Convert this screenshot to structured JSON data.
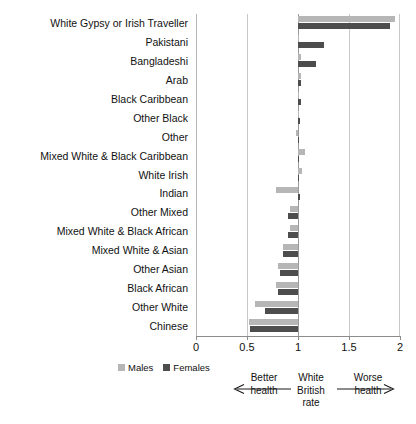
{
  "chart_data": {
    "type": "bar",
    "orientation": "horizontal",
    "title": "",
    "xlabel": "",
    "ylabel": "",
    "xlim": [
      0,
      2
    ],
    "xticks": [
      0,
      0.5,
      1,
      1.5,
      2
    ],
    "xtick_labels": [
      "0",
      "0.5",
      "1",
      "1.5",
      "2"
    ],
    "grid": true,
    "baseline": 1,
    "legend_position": "bottom-left",
    "categories": [
      "White Gypsy or Irish Traveller",
      "Pakistani",
      "Bangladeshi",
      "Arab",
      "Black Caribbean",
      "Other Black",
      "Other",
      "Mixed White & Black Caribbean",
      "White Irish",
      "Indian",
      "Other Mixed",
      "Mixed White & Black African",
      "Mixed White & Asian",
      "Other Asian",
      "Black African",
      "Other White",
      "Chinese"
    ],
    "series": [
      {
        "name": "Males",
        "color": "#b6b6b6",
        "values": [
          1.95,
          1.01,
          1.03,
          1.03,
          1.0,
          1.0,
          0.98,
          1.07,
          1.04,
          0.78,
          0.92,
          0.92,
          0.85,
          0.8,
          0.78,
          0.58,
          0.52
        ]
      },
      {
        "name": "Females",
        "color": "#4d4d4d",
        "values": [
          1.9,
          1.25,
          1.18,
          1.03,
          1.03,
          1.02,
          1.01,
          1.0,
          1.0,
          1.02,
          0.9,
          0.9,
          0.85,
          0.82,
          0.8,
          0.68,
          0.53
        ]
      }
    ],
    "annotations": {
      "left_label_line1": "Better",
      "left_label_line2": "health",
      "center_label_line1": "White",
      "center_label_line2": "British",
      "center_label_line3": "rate",
      "right_label_line1": "Worse",
      "right_label_line2": "health"
    }
  }
}
